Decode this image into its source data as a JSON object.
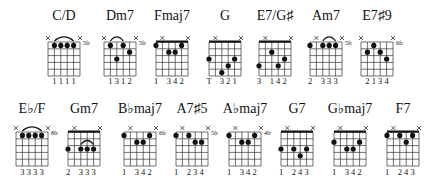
{
  "rows": [
    {
      "title_y": 20,
      "grid_top": 42,
      "fingers_y": 84,
      "chords": [
        {
          "name": "C/D",
          "cx": 64,
          "fret_label": "5fr",
          "mutes": [
            0,
            5
          ],
          "barre_arc": [
            1,
            4
          ],
          "thick_top": false,
          "dots": [
            [
              1,
              0
            ],
            [
              2,
              0
            ],
            [
              3,
              0
            ],
            [
              4,
              0
            ]
          ],
          "fingers": [
            "",
            "1",
            "1",
            "1",
            "1",
            ""
          ]
        },
        {
          "name": "Dm7",
          "cx": 120,
          "fret_label": "5fr",
          "mutes": [
            0,
            5
          ],
          "barre_arc": [
            1,
            3
          ],
          "thick_top": false,
          "dots": [
            [
              1,
              0
            ],
            [
              2,
              2
            ],
            [
              3,
              0
            ],
            [
              4,
              1
            ]
          ],
          "fingers": [
            "",
            "1",
            "3",
            "1",
            "2",
            ""
          ]
        },
        {
          "name": "Fmaj7",
          "cx": 172,
          "fret_label": "",
          "mutes": [
            1,
            5
          ],
          "barre_arc": null,
          "thick_top": true,
          "dots": [
            [
              0,
              0
            ],
            [
              2,
              1
            ],
            [
              3,
              1
            ],
            [
              4,
              0
            ]
          ],
          "fingers": [
            "1",
            "",
            "3",
            "4",
            "2",
            ""
          ]
        },
        {
          "name": "G",
          "cx": 225,
          "fret_label": "",
          "mutes": [
            1,
            5
          ],
          "barre_arc": null,
          "thick_top": true,
          "dots": [
            [
              0,
              2
            ],
            [
              2,
              4
            ],
            [
              3,
              3
            ],
            [
              4,
              2
            ]
          ],
          "fingers": [
            "T",
            "",
            "3",
            "2",
            "1",
            ""
          ]
        },
        {
          "name": "E7/G♯",
          "cx": 275,
          "fret_label": "",
          "mutes": [
            1,
            5
          ],
          "barre_arc": null,
          "thick_top": true,
          "dots": [
            [
              0,
              3
            ],
            [
              2,
              1
            ],
            [
              3,
              3
            ],
            [
              4,
              2
            ]
          ],
          "fingers": [
            "3",
            "",
            "1",
            "4",
            "2",
            ""
          ]
        },
        {
          "name": "Am7",
          "cx": 326,
          "fret_label": "5fr",
          "mutes": [
            1,
            5
          ],
          "barre_arc": [
            2,
            4
          ],
          "thick_top": false,
          "dots": [
            [
              0,
              0
            ],
            [
              2,
              0
            ],
            [
              3,
              0
            ],
            [
              4,
              0
            ]
          ],
          "fingers": [
            "2",
            "",
            "3",
            "3",
            "3",
            ""
          ]
        },
        {
          "name": "E7♯9",
          "cx": 377,
          "fret_label": "6fr",
          "mutes": [
            0,
            5
          ],
          "barre_arc": null,
          "thick_top": false,
          "dots": [
            [
              1,
              1
            ],
            [
              2,
              0
            ],
            [
              3,
              1
            ],
            [
              4,
              2
            ]
          ],
          "fingers": [
            "",
            "2",
            "1",
            "3",
            "4",
            ""
          ]
        }
      ]
    },
    {
      "title_y": 113,
      "grid_top": 132,
      "fingers_y": 175,
      "chords": [
        {
          "name": "E♭/F",
          "cx": 32,
          "fret_label": "8fr",
          "mutes": [
            0,
            5
          ],
          "barre_arc": [
            1,
            4
          ],
          "thick_top": false,
          "dots": [
            [
              1,
              0
            ],
            [
              2,
              0
            ],
            [
              3,
              0
            ],
            [
              4,
              0
            ]
          ],
          "fingers": [
            "",
            "3",
            "3",
            "3",
            "3",
            ""
          ]
        },
        {
          "name": "Gm7",
          "cx": 84,
          "fret_label": "",
          "mutes": [
            1,
            5
          ],
          "barre_arc": [
            2,
            4
          ],
          "thick_top": true,
          "dots": [
            [
              0,
              2
            ],
            [
              2,
              2
            ],
            [
              3,
              2
            ],
            [
              4,
              2
            ]
          ],
          "fingers": [
            "2",
            "",
            "3",
            "3",
            "3",
            ""
          ]
        },
        {
          "name": "B♭maj7",
          "cx": 140,
          "fret_label": "6fr",
          "mutes": [
            1,
            5
          ],
          "barre_arc": null,
          "thick_top": false,
          "dots": [
            [
              0,
              0
            ],
            [
              2,
              1
            ],
            [
              3,
              1
            ],
            [
              4,
              0
            ]
          ],
          "fingers": [
            "1",
            "",
            "3",
            "4",
            "2",
            ""
          ]
        },
        {
          "name": "A7♯5",
          "cx": 192,
          "fret_label": "5fr",
          "mutes": [
            1,
            5
          ],
          "barre_arc": null,
          "thick_top": false,
          "dots": [
            [
              0,
              0
            ],
            [
              2,
              0
            ],
            [
              3,
              1
            ],
            [
              4,
              1
            ]
          ],
          "fingers": [
            "1",
            "",
            "2",
            "3",
            "4",
            ""
          ]
        },
        {
          "name": "A♭maj7",
          "cx": 245,
          "fret_label": "4fr",
          "mutes": [
            1,
            5
          ],
          "barre_arc": null,
          "thick_top": false,
          "dots": [
            [
              0,
              0
            ],
            [
              2,
              1
            ],
            [
              3,
              1
            ],
            [
              4,
              0
            ]
          ],
          "fingers": [
            "1",
            "",
            "3",
            "4",
            "2",
            ""
          ]
        },
        {
          "name": "G7",
          "cx": 297,
          "fret_label": "",
          "mutes": [
            1,
            5
          ],
          "barre_arc": null,
          "thick_top": true,
          "dots": [
            [
              0,
              2
            ],
            [
              2,
              2
            ],
            [
              3,
              3
            ],
            [
              4,
              2
            ]
          ],
          "fingers": [
            "1",
            "",
            "2",
            "4",
            "3",
            ""
          ]
        },
        {
          "name": "G♭maj7",
          "cx": 350,
          "fret_label": "",
          "mutes": [
            1,
            5
          ],
          "barre_arc": null,
          "thick_top": true,
          "dots": [
            [
              0,
              1
            ],
            [
              2,
              2
            ],
            [
              3,
              2
            ],
            [
              4,
              1
            ]
          ],
          "fingers": [
            "1",
            "",
            "3",
            "4",
            "2",
            ""
          ]
        },
        {
          "name": "F7",
          "cx": 403,
          "fret_label": "",
          "mutes": [
            1,
            5
          ],
          "barre_arc": null,
          "thick_top": true,
          "dots": [
            [
              0,
              0
            ],
            [
              2,
              0
            ],
            [
              3,
              1
            ],
            [
              4,
              0
            ]
          ],
          "fingers": [
            "1",
            "",
            "2",
            "4",
            "3",
            ""
          ]
        }
      ]
    }
  ],
  "style": {
    "ink": "#111111",
    "grid": "#333333",
    "background": "#ffffff"
  }
}
